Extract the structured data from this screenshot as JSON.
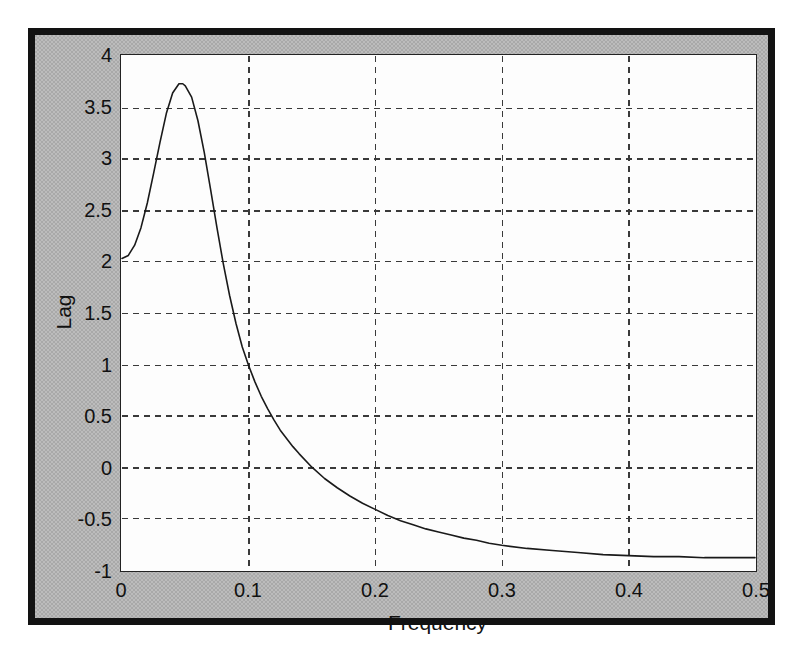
{
  "figure": {
    "background_color": "#a9a9a9",
    "frame_color": "#121212",
    "axes_background_color": "#fdfdfd",
    "axes_border_color": "#232323",
    "grid_color": "#3a3a3a",
    "line_color": "#1a1a1a"
  },
  "chart_data": {
    "type": "line",
    "title": "",
    "subtitle": "",
    "xlabel": "Frequency",
    "ylabel": "Lag",
    "xlim": [
      0,
      0.5
    ],
    "ylim": [
      -1,
      4
    ],
    "xticks": [
      0,
      0.1,
      0.2,
      0.3,
      0.4,
      0.5
    ],
    "xticklabels": [
      "0",
      "0.1",
      "0.2",
      "0.3",
      "0.4",
      "0.5"
    ],
    "yticks": [
      -1,
      -0.5,
      0,
      0.5,
      1,
      1.5,
      2,
      2.5,
      3,
      3.5,
      4
    ],
    "yticklabels": [
      "-1",
      "-0.5",
      "0",
      "0.5",
      "1",
      "1.5",
      "2",
      "2.5",
      "3",
      "3.5",
      "4"
    ],
    "grid": true,
    "grid_style": "dashed",
    "legend": null,
    "legend_position": "none",
    "annotations": [],
    "series": [
      {
        "name": "Lag",
        "x": [
          0.0,
          0.005,
          0.01,
          0.015,
          0.02,
          0.025,
          0.03,
          0.035,
          0.04,
          0.045,
          0.048,
          0.05,
          0.055,
          0.06,
          0.065,
          0.07,
          0.075,
          0.08,
          0.085,
          0.09,
          0.095,
          0.1,
          0.105,
          0.11,
          0.115,
          0.12,
          0.125,
          0.13,
          0.135,
          0.14,
          0.15,
          0.16,
          0.17,
          0.18,
          0.19,
          0.2,
          0.21,
          0.22,
          0.23,
          0.24,
          0.25,
          0.26,
          0.27,
          0.28,
          0.29,
          0.3,
          0.32,
          0.34,
          0.36,
          0.38,
          0.4,
          0.42,
          0.44,
          0.46,
          0.48,
          0.5
        ],
        "y": [
          2.03,
          2.06,
          2.16,
          2.33,
          2.57,
          2.86,
          3.16,
          3.44,
          3.64,
          3.73,
          3.73,
          3.71,
          3.6,
          3.37,
          3.06,
          2.7,
          2.33,
          1.98,
          1.67,
          1.4,
          1.17,
          0.99,
          0.83,
          0.69,
          0.57,
          0.46,
          0.36,
          0.28,
          0.2,
          0.13,
          0.0,
          -0.11,
          -0.2,
          -0.28,
          -0.35,
          -0.41,
          -0.47,
          -0.52,
          -0.56,
          -0.6,
          -0.63,
          -0.66,
          -0.69,
          -0.71,
          -0.74,
          -0.76,
          -0.79,
          -0.81,
          -0.83,
          -0.85,
          -0.86,
          -0.87,
          -0.87,
          -0.88,
          -0.88,
          -0.88
        ]
      }
    ],
    "peak": {
      "x": 0.048,
      "y": 3.73
    },
    "start": {
      "x": 0.0,
      "y": 2.03
    },
    "zero_crossing": {
      "x": 0.15,
      "y": 0.0
    },
    "asymptote": -0.88
  }
}
